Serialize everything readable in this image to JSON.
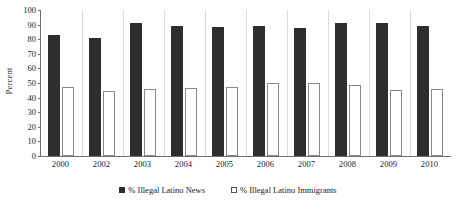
{
  "chart_data": {
    "type": "bar",
    "title": "",
    "subtitle": "",
    "xlabel": "",
    "ylabel": "Percent",
    "ylim": [
      0,
      100
    ],
    "ytick_interval": 10,
    "yticks": [
      0,
      10,
      20,
      30,
      40,
      50,
      60,
      70,
      80,
      90,
      100
    ],
    "ytick_labels": [
      "0",
      "10",
      "20",
      "30",
      "40",
      "50",
      "60",
      "70",
      "80",
      "90",
      "100"
    ],
    "grid": false,
    "legend_position": "bottom",
    "categories": [
      "2000",
      "2002",
      "2003",
      "2004",
      "2005",
      "2006",
      "2007",
      "2008",
      "2009",
      "2010"
    ],
    "series": [
      {
        "name": "% Illegal Latino News",
        "color": "#2e2e2e",
        "marker": "filled-square",
        "values": [
          83,
          81,
          91,
          89,
          88.5,
          89,
          88,
          91,
          91,
          89
        ]
      },
      {
        "name": "% Illegal Latino Immigrants",
        "color": "#ffffff",
        "marker": "hollow-square",
        "values": [
          47,
          44.5,
          46,
          46.5,
          47.5,
          50,
          50,
          48.5,
          45.5,
          46
        ]
      }
    ],
    "annotations": []
  },
  "legend": {
    "entries": [
      {
        "label": "% Illegal Latino News"
      },
      {
        "label": "% Illegal Latino Immigrants"
      }
    ]
  },
  "colors": {
    "series_news": "#2e2e2e",
    "series_immigrants": "#ffffff",
    "axis": "#6e6e6e",
    "separator": "#dcdcdc",
    "background": "#ffffff",
    "text": "#1a1a1a"
  }
}
